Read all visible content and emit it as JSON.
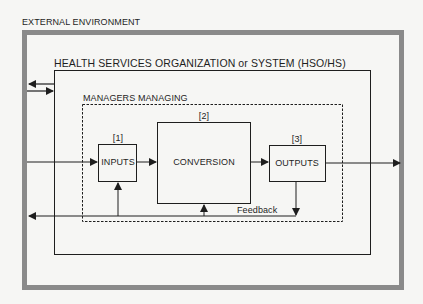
{
  "diagram": {
    "outer_label": "EXTERNAL ENVIRONMENT",
    "organization_label": "HEALTH SERVICES ORGANIZATION or SYSTEM (HSO/HS)",
    "managers_label": "MANAGERS MANAGING",
    "nodes": [
      {
        "id": "inputs",
        "number": "[1]",
        "label": "INPUTS"
      },
      {
        "id": "conversion",
        "number": "[2]",
        "label": "CONVERSION"
      },
      {
        "id": "outputs",
        "number": "[3]",
        "label": "OUTPUTS"
      }
    ],
    "feedback_label": "Feedback",
    "colors": {
      "outer_border": "#8a8a8a",
      "lines": "#1e1e1e",
      "background": "#f6f6f4"
    }
  }
}
